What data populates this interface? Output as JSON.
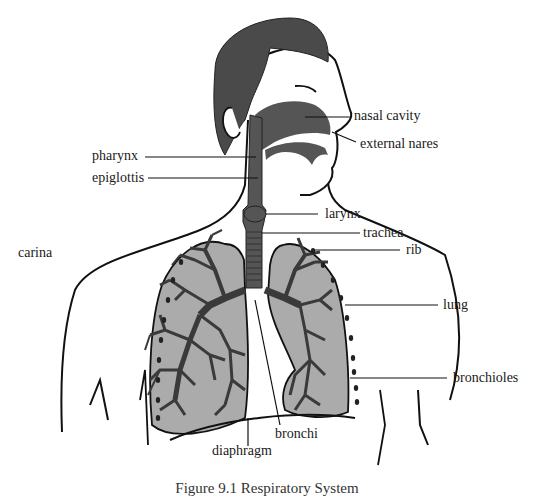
{
  "figure": {
    "caption": "Figure 9.1 Respiratory System",
    "colors": {
      "hair": "#4a4a4a",
      "airway": "#555555",
      "lung_fill": "#ababab",
      "bronchial_tree": "#3a3a3a",
      "outline": "#111111",
      "background": "#ffffff"
    },
    "labels": {
      "nasal_cavity": "nasal cavity",
      "external_nares": "external nares",
      "pharynx": "pharynx",
      "epiglottis": "epiglottis",
      "larynx": "larynx",
      "trachea": "trachea",
      "rib": "rib",
      "carina": "carina",
      "lung": "lung",
      "bronchioles": "bronchioles",
      "bronchi": "bronchi",
      "diaphragm": "diaphragm"
    }
  }
}
